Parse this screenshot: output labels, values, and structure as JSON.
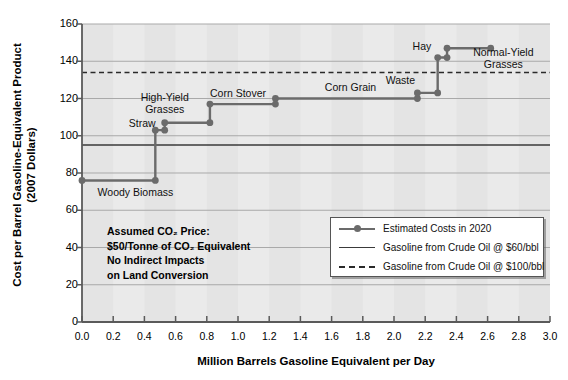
{
  "chart_data": {
    "type": "line",
    "title": "",
    "xlabel": "Million Barrels Gasoline Equivalent per Day",
    "ylabel": "Cost per Barrel Gasoline-Equivalent Product\n(2007 Dollars)",
    "ylabel_line1": "Cost per Barrel Gasoline-Equivalent Product",
    "ylabel_line2": "(2007 Dollars)",
    "xlim": [
      0.0,
      3.0
    ],
    "ylim": [
      0,
      160
    ],
    "grid": true,
    "xticks": [
      "0.0",
      "0.2",
      "0.4",
      "0.6",
      "0.8",
      "1.0",
      "1.2",
      "1.4",
      "1.6",
      "1.8",
      "2.0",
      "2.2",
      "2.4",
      "2.6",
      "2.8",
      "3.0"
    ],
    "xtick_values": [
      0.0,
      0.2,
      0.4,
      0.6,
      0.8,
      1.0,
      1.2,
      1.4,
      1.6,
      1.8,
      2.0,
      2.2,
      2.4,
      2.6,
      2.8,
      3.0
    ],
    "yticks": [
      "0",
      "20",
      "40",
      "60",
      "80",
      "100",
      "120",
      "140",
      "160"
    ],
    "ytick_values": [
      0,
      20,
      40,
      60,
      80,
      100,
      120,
      140,
      160
    ],
    "series_name": "Estimated Costs in 2020",
    "series_color": "#6b6b6b",
    "steps": [
      {
        "label": "Woody Biomass",
        "x_start": 0.0,
        "x_end": 0.47,
        "cost": 76,
        "label_x": 0.1,
        "label_y": 70,
        "label_align": "left"
      },
      {
        "label": "Straw",
        "x_start": 0.47,
        "x_end": 0.53,
        "cost": 103,
        "label_x": 0.3,
        "label_y": 107,
        "label_align": "left"
      },
      {
        "label": "High-Yield\nGrasses",
        "x_start": 0.53,
        "x_end": 0.82,
        "cost": 107,
        "label_x": 0.53,
        "label_y": 121,
        "label_align": "center"
      },
      {
        "label": "Corn Stover",
        "x_start": 0.82,
        "x_end": 1.24,
        "cost": 117,
        "label_x": 1.0,
        "label_y": 123,
        "label_align": "center"
      },
      {
        "label": "Corn Grain",
        "x_start": 1.24,
        "x_end": 2.15,
        "cost": 120,
        "label_x": 1.72,
        "label_y": 126,
        "label_align": "center"
      },
      {
        "label": "Waste",
        "x_start": 2.15,
        "x_end": 2.28,
        "cost": 123,
        "label_x": 2.04,
        "label_y": 130,
        "label_align": "center"
      },
      {
        "label": "Hay",
        "x_start": 2.28,
        "x_end": 2.34,
        "cost": 142,
        "label_x": 2.18,
        "label_y": 148,
        "label_align": "center"
      },
      {
        "label": "Normal-Yield\nGrasses",
        "x_start": 2.34,
        "x_end": 2.62,
        "cost": 147,
        "label_x": 2.7,
        "label_y": 145,
        "label_align": "center"
      }
    ],
    "reference_lines": [
      {
        "name": "Gasoline from Crude Oil @ $60/bbl",
        "value": 95,
        "style": "solid",
        "color": "#3a3a3a"
      },
      {
        "name": "Gasoline from Crude Oil @ $100/bbl",
        "value": 134,
        "style": "dashed",
        "color": "#2a2a2a"
      }
    ]
  },
  "legend": {
    "items": [
      {
        "key": "marker-line",
        "label": "Estimated Costs in 2020"
      },
      {
        "key": "solid-line",
        "label": "Gasoline from Crude Oil @ $60/bbl"
      },
      {
        "key": "dashed-line",
        "label": "Gasoline from Crude Oil @ $100/bbl"
      }
    ]
  },
  "annotation": {
    "lines": [
      "Assumed CO₂ Price:",
      "$50/Tonne of CO₂ Equivalent",
      "No Indirect Impacts",
      "on Land Conversion"
    ]
  }
}
